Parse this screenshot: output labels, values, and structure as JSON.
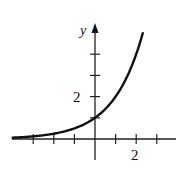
{
  "chart_data": {
    "type": "line",
    "title": "",
    "xlabel": "",
    "ylabel": "y",
    "function": "y = 2^x",
    "x": [
      -4,
      -3,
      -2,
      -1,
      0,
      1,
      2,
      2.32
    ],
    "series": [
      {
        "name": "y = 2^x",
        "values": [
          0.0625,
          0.125,
          0.25,
          0.5,
          1,
          2,
          4,
          5
        ]
      }
    ],
    "x_ticks": [
      -3,
      -2,
      -1,
      1,
      2,
      3
    ],
    "y_ticks": [
      1,
      2,
      3,
      4
    ],
    "x_tick_labels": {
      "2": "2"
    },
    "y_tick_labels": {
      "2": "2"
    },
    "xlim": [
      -4,
      3.8
    ],
    "ylim": [
      -1,
      5.5
    ],
    "grid": false,
    "legend": "none",
    "colors": {
      "curve": "#111111",
      "axes": "#222222"
    }
  },
  "labels": {
    "y_axis": "y",
    "x_tick_2": "2",
    "y_tick_2": "2"
  }
}
